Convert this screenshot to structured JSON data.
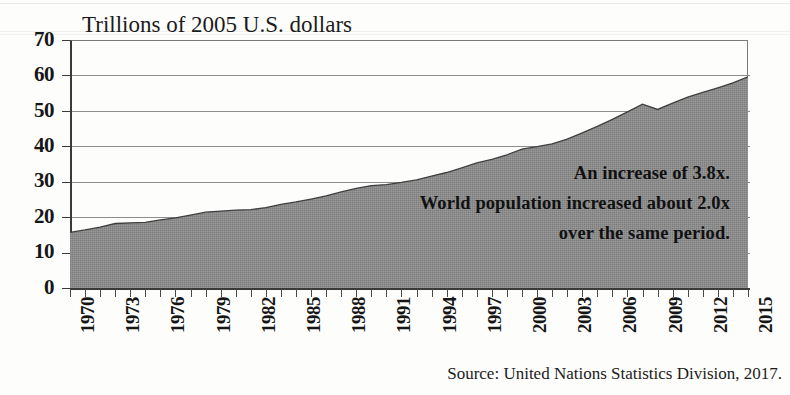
{
  "chart_data": {
    "type": "area",
    "title": "Trillions of 2005 U.S. dollars",
    "xlabel": "",
    "ylabel": "",
    "xlim": [
      1970,
      2015
    ],
    "ylim": [
      0,
      70
    ],
    "grid": true,
    "legend": false,
    "fill_color": "#8b8b8b",
    "line_color": "#3a3a3a",
    "y_ticks": [
      "70",
      "60",
      "50",
      "40",
      "30",
      "20",
      "10",
      "0"
    ],
    "x_ticks": [
      "1970",
      "1973",
      "1976",
      "1979",
      "1982",
      "1985",
      "1988",
      "1991",
      "1994",
      "1997",
      "2000",
      "2003",
      "2006",
      "2009",
      "2012",
      "2015"
    ],
    "x": [
      1970,
      1971,
      1972,
      1973,
      1974,
      1975,
      1976,
      1977,
      1978,
      1979,
      1980,
      1981,
      1982,
      1983,
      1984,
      1985,
      1986,
      1987,
      1988,
      1989,
      1990,
      1991,
      1992,
      1993,
      1994,
      1995,
      1996,
      1997,
      1998,
      1999,
      2000,
      2001,
      2002,
      2003,
      2004,
      2005,
      2006,
      2007,
      2008,
      2009,
      2010,
      2011,
      2012,
      2013,
      2014,
      2015
    ],
    "values": [
      15.7,
      16.4,
      17.2,
      18.2,
      18.4,
      18.5,
      19.2,
      19.8,
      20.6,
      21.4,
      21.7,
      22.0,
      22.1,
      22.7,
      23.6,
      24.3,
      25.1,
      26.0,
      27.1,
      28.1,
      28.9,
      29.2,
      29.8,
      30.5,
      31.6,
      32.6,
      33.9,
      35.3,
      36.3,
      37.6,
      39.2,
      39.9,
      40.7,
      42.0,
      43.8,
      45.6,
      47.6,
      49.7,
      51.9,
      50.4,
      52.2,
      53.9,
      55.2,
      56.5,
      57.9,
      59.6
    ],
    "annotations": [
      "An increase of 3.8x.",
      "World population increased about 2.0x",
      "over the same period."
    ],
    "source": "Source: United Nations Statistics Division, 2017."
  }
}
